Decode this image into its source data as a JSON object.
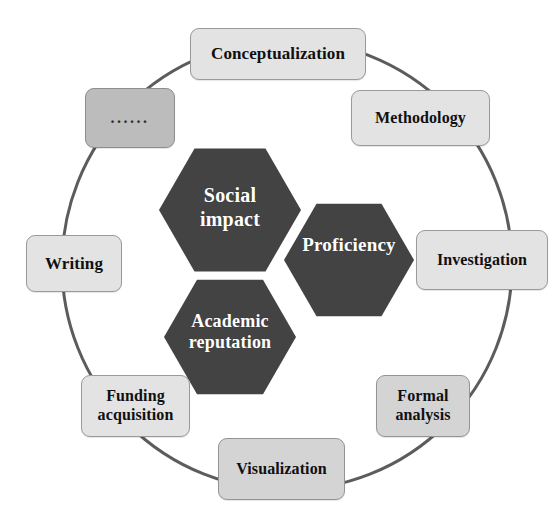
{
  "diagram": {
    "colors": {
      "hexagon_fill": "#434343",
      "hexagon_text": "#ffffff",
      "node_fill": "#e3e3e3",
      "node_fill_dim": "#bcbcbc",
      "node_border": "#9a9a9a",
      "ring_stroke": "#5c5c5c",
      "background": "#ffffff"
    },
    "ring": {
      "center_x": 287,
      "center_y": 265,
      "radius": 225,
      "stroke_width": 3
    },
    "core": {
      "label": "core competencies",
      "hexagons": [
        {
          "id": "social-impact",
          "label": "Social impact",
          "line1": "Social",
          "line2": "impact",
          "cx": 230,
          "cy": 210,
          "r": 71
        },
        {
          "id": "proficiency",
          "label": "Proficiency",
          "line1": "Proficiency",
          "line2": "",
          "cx": 349,
          "cy": 260,
          "r": 65
        },
        {
          "id": "academic-reputation",
          "label": "Academic reputation",
          "line1": "Academic",
          "line2": "reputation",
          "cx": 230,
          "cy": 337,
          "r": 66
        }
      ]
    },
    "nodes": [
      {
        "id": "conceptualization",
        "label": "Conceptualization",
        "shade": "light",
        "x": 190,
        "y": 28,
        "w": 176,
        "h": 52,
        "font_size": 17
      },
      {
        "id": "methodology",
        "label": "Methodology",
        "shade": "light",
        "x": 351,
        "y": 90,
        "w": 139,
        "h": 56,
        "font_size": 16
      },
      {
        "id": "investigation",
        "label": "Investigation",
        "shade": "light",
        "x": 416,
        "y": 230,
        "w": 132,
        "h": 60,
        "font_size": 16
      },
      {
        "id": "formal-analysis",
        "label": "Formal analysis",
        "line1": "Formal",
        "line2": "analysis",
        "shade": "mid",
        "x": 376,
        "y": 375,
        "w": 94,
        "h": 62,
        "font_size": 16
      },
      {
        "id": "visualization",
        "label": "Visualization",
        "shade": "mid",
        "x": 218,
        "y": 438,
        "w": 127,
        "h": 62,
        "font_size": 16
      },
      {
        "id": "funding-acquisition",
        "label": "Funding acquisition",
        "line1": "Funding",
        "line2": "acquisition",
        "shade": "light",
        "x": 81,
        "y": 375,
        "w": 109,
        "h": 62,
        "font_size": 16
      },
      {
        "id": "writing",
        "label": "Writing",
        "shade": "light",
        "x": 26,
        "y": 235,
        "w": 96,
        "h": 57,
        "font_size": 17
      },
      {
        "id": "ellipsis",
        "label": "......",
        "shade": "dim",
        "x": 85,
        "y": 88,
        "w": 90,
        "h": 60,
        "font_size": 16
      }
    ]
  }
}
